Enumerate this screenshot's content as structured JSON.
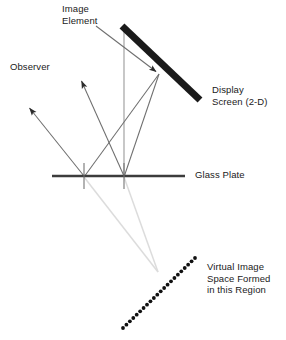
{
  "diagram": {
    "type": "optical-ray-diagram",
    "canvas": {
      "width": 286,
      "height": 340
    },
    "colors": {
      "screen": "#1a1a1a",
      "glass_plate": "#3c3c3c",
      "ray_solid": "#666666",
      "ray_faint": "#d8d8d8",
      "dotted": "#111111",
      "text": "#1a1a1a",
      "background": "#ffffff"
    },
    "labels": {
      "image_element": "Image\nElement",
      "observer": "Observer",
      "display_screen": "Display\nScreen (2-D)",
      "glass_plate": "Glass Plate",
      "virtual_image": "Virtual Image\nSpace Formed\nin this Region"
    },
    "geometry": {
      "display_screen": {
        "x1": 122,
        "y1": 26,
        "x2": 200,
        "y2": 100,
        "thickness": 7
      },
      "glass_plate": {
        "x1": 52,
        "y1": 176,
        "x2": 185,
        "y2": 176,
        "thickness": 2.2
      },
      "glass_plate_ticks": [
        {
          "x": 84,
          "y1": 163,
          "y2": 189
        },
        {
          "x": 124,
          "y1": 163,
          "y2": 189
        }
      ],
      "vertical_axis": {
        "x": 124,
        "y1": 28,
        "y2": 177
      },
      "image_element_point": {
        "x": 159,
        "y": 74
      },
      "image_element_pointer": {
        "x1": 96,
        "y1": 26,
        "x2": 159,
        "y2": 74
      },
      "observer_arrows": [
        {
          "x1": 124,
          "y1": 176,
          "x2": 79,
          "y2": 76
        },
        {
          "x1": 84,
          "y1": 176,
          "x2": 26,
          "y2": 104
        }
      ],
      "incident_rays": [
        {
          "x1": 159,
          "y1": 74,
          "x2": 124,
          "y2": 176
        },
        {
          "x1": 159,
          "y1": 74,
          "x2": 84,
          "y2": 176
        }
      ],
      "virtual_rays": [
        {
          "x1": 124,
          "y1": 177,
          "x2": 158,
          "y2": 272
        },
        {
          "x1": 84,
          "y1": 177,
          "x2": 158,
          "y2": 272
        }
      ],
      "virtual_image_plane": {
        "x1": 123,
        "y1": 328,
        "x2": 195,
        "y2": 258,
        "dot_radius": 1.9,
        "dot_count": 22
      }
    }
  }
}
